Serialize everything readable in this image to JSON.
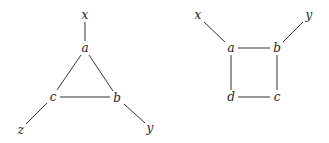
{
  "diagrams": [
    {
      "name": "triangle-graph",
      "nodes": [
        {
          "id": "x",
          "label": "x",
          "x": 85,
          "y": 15
        },
        {
          "id": "a",
          "label": "a",
          "x": 85,
          "y": 48
        },
        {
          "id": "c",
          "label": "c",
          "x": 53,
          "y": 97
        },
        {
          "id": "b",
          "label": "b",
          "x": 117,
          "y": 98
        },
        {
          "id": "z",
          "label": "z",
          "x": 21,
          "y": 130
        },
        {
          "id": "y",
          "label": "y",
          "x": 150,
          "y": 128
        }
      ],
      "edges": [
        {
          "from": "x",
          "to": "a",
          "x1": 85,
          "y1": 22,
          "x2": 85,
          "y2": 41
        },
        {
          "from": "a",
          "to": "c",
          "x1": 81,
          "y1": 55,
          "x2": 57,
          "y2": 90
        },
        {
          "from": "a",
          "to": "b",
          "x1": 89,
          "y1": 55,
          "x2": 113,
          "y2": 91
        },
        {
          "from": "c",
          "to": "b",
          "x1": 60,
          "y1": 97,
          "x2": 110,
          "y2": 97
        },
        {
          "from": "c",
          "to": "z",
          "x1": 47,
          "y1": 103,
          "x2": 26,
          "y2": 124
        },
        {
          "from": "b",
          "to": "y",
          "x1": 124,
          "y1": 104,
          "x2": 145,
          "y2": 123
        }
      ]
    },
    {
      "name": "square-graph",
      "nodes": [
        {
          "id": "x",
          "label": "x",
          "x": 198,
          "y": 15
        },
        {
          "id": "y",
          "label": "y",
          "x": 309,
          "y": 15
        },
        {
          "id": "a",
          "label": "a",
          "x": 231,
          "y": 48
        },
        {
          "id": "b",
          "label": "b",
          "x": 277,
          "y": 48
        },
        {
          "id": "d",
          "label": "d",
          "x": 231,
          "y": 97
        },
        {
          "id": "c",
          "label": "c",
          "x": 277,
          "y": 97
        }
      ],
      "edges": [
        {
          "from": "x",
          "to": "a",
          "x1": 204,
          "y1": 22,
          "x2": 225,
          "y2": 42
        },
        {
          "from": "y",
          "to": "b",
          "x1": 303,
          "y1": 22,
          "x2": 283,
          "y2": 42
        },
        {
          "from": "a",
          "to": "b",
          "x1": 238,
          "y1": 48,
          "x2": 270,
          "y2": 48
        },
        {
          "from": "a",
          "to": "d",
          "x1": 231,
          "y1": 55,
          "x2": 231,
          "y2": 90
        },
        {
          "from": "b",
          "to": "c",
          "x1": 277,
          "y1": 55,
          "x2": 277,
          "y2": 90
        },
        {
          "from": "d",
          "to": "c",
          "x1": 238,
          "y1": 97,
          "x2": 270,
          "y2": 97
        }
      ]
    }
  ]
}
